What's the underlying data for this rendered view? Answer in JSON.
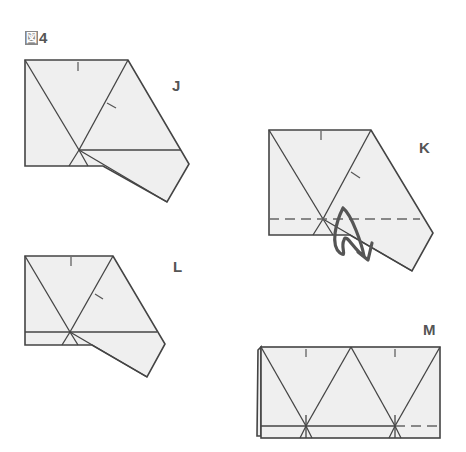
{
  "figure": {
    "title_kanji": "図",
    "title_number": "4"
  },
  "steps": [
    {
      "id": "J",
      "label": "J"
    },
    {
      "id": "K",
      "label": "K"
    },
    {
      "id": "L",
      "label": "L"
    },
    {
      "id": "M",
      "label": "M"
    }
  ],
  "colors": {
    "paper_fill": "#efefef",
    "line": "#444444",
    "label": "#555555"
  }
}
